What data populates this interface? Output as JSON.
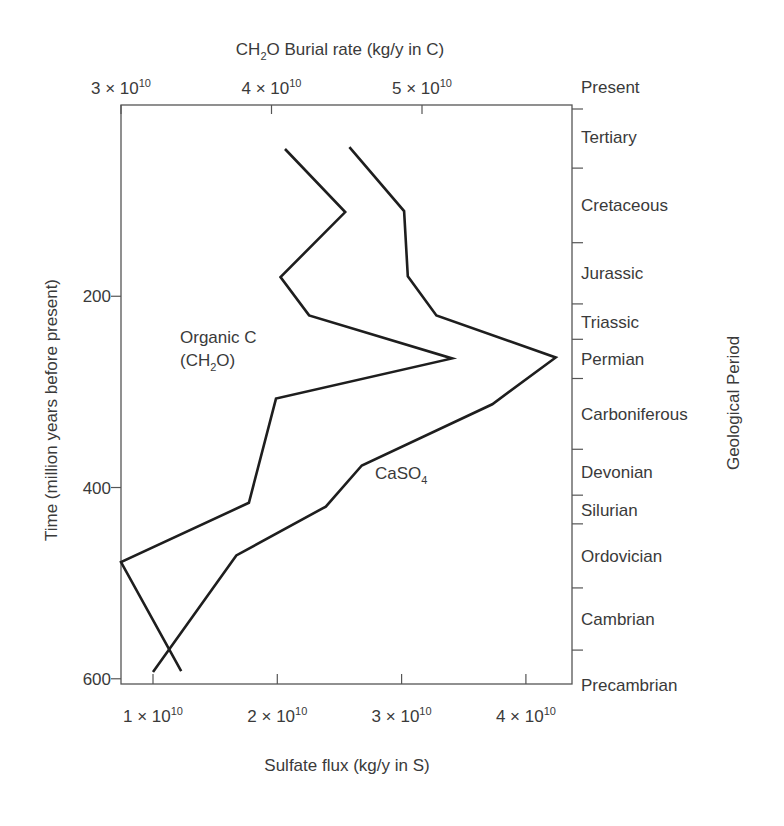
{
  "chart_data": {
    "type": "line",
    "orientation": "vertical-time",
    "title": "",
    "top_axis": {
      "label": "CH2O Burial rate (kg/y in C)",
      "label_parts": {
        "pre": "CH",
        "sub": "2",
        "post": "O Burial rate (kg/y in C)"
      },
      "ticks": [
        {
          "value": 30000000000.0,
          "mantissa": "3",
          "exp": "10"
        },
        {
          "value": 40000000000.0,
          "mantissa": "4",
          "exp": "10"
        },
        {
          "value": 50000000000.0,
          "mantissa": "5",
          "exp": "10"
        }
      ],
      "range": [
        30000000000.0,
        60000000000.0
      ]
    },
    "bottom_axis": {
      "label": "Sulfate flux (kg/y in S)",
      "ticks": [
        {
          "value": 10000000000.0,
          "mantissa": "1",
          "exp": "10"
        },
        {
          "value": 20000000000.0,
          "mantissa": "2",
          "exp": "10"
        },
        {
          "value": 30000000000.0,
          "mantissa": "3",
          "exp": "10"
        },
        {
          "value": 40000000000.0,
          "mantissa": "4",
          "exp": "10"
        }
      ],
      "range": [
        7400000000.0,
        43800000000.0
      ]
    },
    "left_axis": {
      "label": "Time (million years before present)",
      "ticks": [
        200,
        400,
        600
      ],
      "range": [
        0,
        605
      ],
      "inverted": true
    },
    "right_axis": {
      "label": "Geological Period",
      "boundaries_myr": [
        0,
        66,
        144,
        208,
        245,
        286,
        360,
        408,
        438,
        505,
        570
      ],
      "periods": [
        "Present",
        "Tertiary",
        "Cretaceous",
        "Jurassic",
        "Triassic",
        "Permian",
        "Carboniferous",
        "Devonian",
        "Silurian",
        "Ordovician",
        "Cambrian",
        "Precambrian"
      ]
    },
    "series": [
      {
        "name": "Organic C (CH2O)",
        "label_line1": "Organic C",
        "label_line2_parts": {
          "pre": "(CH",
          "sub": "2",
          "post": "O)"
        },
        "x_axis": "top",
        "units": "kg/y in C",
        "points": [
          {
            "time": 46,
            "value": 40900000000.0
          },
          {
            "time": 112,
            "value": 44900000000.0
          },
          {
            "time": 180,
            "value": 40600000000.0
          },
          {
            "time": 220,
            "value": 42500000000.0
          },
          {
            "time": 265,
            "value": 52000000000.0
          },
          {
            "time": 307,
            "value": 40300000000.0
          },
          {
            "time": 416,
            "value": 38500000000.0
          },
          {
            "time": 478,
            "value": 30000000000.0
          },
          {
            "time": 592,
            "value": 34000000000.0
          }
        ]
      },
      {
        "name": "CaSO4",
        "label_parts": {
          "pre": "CaSO",
          "sub": "4",
          "post": ""
        },
        "x_axis": "bottom",
        "units": "kg/y in S",
        "points": [
          {
            "time": 44,
            "value": 25800000000.0
          },
          {
            "time": 111,
            "value": 30200000000.0
          },
          {
            "time": 179,
            "value": 30500000000.0
          },
          {
            "time": 220,
            "value": 32800000000.0
          },
          {
            "time": 264,
            "value": 42400000000.0
          },
          {
            "time": 313,
            "value": 37300000000.0
          },
          {
            "time": 377,
            "value": 26800000000.0
          },
          {
            "time": 420,
            "value": 23900000000.0
          },
          {
            "time": 471,
            "value": 16700000000.0
          },
          {
            "time": 593,
            "value": 10000000000.0
          }
        ]
      }
    ],
    "grid": false,
    "legend": "inline labels"
  }
}
